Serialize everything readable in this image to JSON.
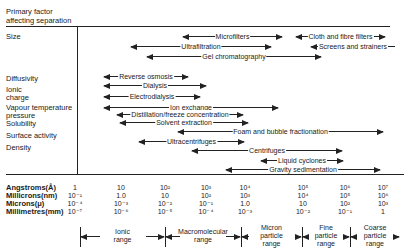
{
  "header": {
    "line1": "Primary factor",
    "line2": "affecting separation"
  },
  "factors": [
    {
      "label": "Size",
      "y": 38
    },
    {
      "label": "Diffusivity",
      "y": 80
    },
    {
      "label": "Ionic",
      "y": 91
    },
    {
      "label": "charge",
      "y": 99
    },
    {
      "label": "Vapour temperature",
      "y": 109
    },
    {
      "label": "pressure",
      "y": 117
    },
    {
      "label": "Solubility",
      "y": 125
    },
    {
      "label": "Surface activity",
      "y": 137
    },
    {
      "label": "Density",
      "y": 149
    }
  ],
  "methods": [
    {
      "label": "Microfilters",
      "x1": 183,
      "x2": 282,
      "y": 36
    },
    {
      "label": "Cloth and fibre filters",
      "x1": 296,
      "x2": 385,
      "y": 36
    },
    {
      "label": "Ultrafiltration",
      "x1": 131,
      "x2": 271,
      "y": 46
    },
    {
      "label": "Screens and strainers",
      "x1": 311,
      "x2": 395,
      "y": 46,
      "no_right_head": true
    },
    {
      "label": "Gel chromatography",
      "x1": 147,
      "x2": 321,
      "y": 56
    },
    {
      "label": "Reverse osmosis",
      "x1": 104,
      "x2": 188,
      "y": 76
    },
    {
      "label": "Dialysis",
      "x1": 104,
      "x2": 206,
      "y": 85
    },
    {
      "label": "Electrodialysis",
      "x1": 104,
      "x2": 200,
      "y": 96
    },
    {
      "label": "Ion exchange",
      "x1": 104,
      "x2": 278,
      "y": 107
    },
    {
      "label": "Distillation/freeze concentration",
      "x1": 117,
      "x2": 243,
      "y": 114
    },
    {
      "label": "Solvent extraction",
      "x1": 120,
      "x2": 248,
      "y": 122
    },
    {
      "label": "Foam and bubble fractionation",
      "x1": 178,
      "x2": 383,
      "y": 131
    },
    {
      "label": "Ultracentrifuges",
      "x1": 139,
      "x2": 244,
      "y": 141
    },
    {
      "label": "Centrifuges",
      "x1": 192,
      "x2": 342,
      "y": 150
    },
    {
      "label": "Liquid cyclones",
      "x1": 261,
      "x2": 343,
      "y": 160
    },
    {
      "label": "Gravity sedimentation",
      "x1": 226,
      "x2": 380,
      "y": 169
    }
  ],
  "scale": {
    "units": [
      "Angstroms(Å)",
      "Millicrons(nm)",
      "Microns(μ)",
      "Millimetres(mm)"
    ],
    "columns": [
      {
        "x": 75,
        "values": [
          "1",
          "10⁻¹",
          "10⁻⁴",
          "10⁻⁷"
        ]
      },
      {
        "x": 121,
        "values": [
          "10",
          "1.0",
          "10⁻³",
          "10⁻⁶"
        ]
      },
      {
        "x": 165,
        "values": [
          "10²",
          "10",
          "10⁻²",
          "10⁻⁵"
        ]
      },
      {
        "x": 206,
        "values": [
          "10³",
          "10²",
          "10⁻¹",
          "10⁻⁴"
        ]
      },
      {
        "x": 245,
        "values": [
          "10⁴",
          "10³",
          "1.0",
          "10⁻³"
        ]
      },
      {
        "x": 303,
        "values": [
          "10⁵",
          "10⁴",
          "10",
          "10⁻²"
        ]
      },
      {
        "x": 345,
        "values": [
          "10⁶",
          "10⁵",
          "10²",
          "10⁻¹"
        ]
      },
      {
        "x": 383,
        "values": [
          "10⁷",
          "10⁶",
          "10³",
          "1"
        ]
      }
    ]
  },
  "ranges": [
    {
      "line1": "Ionic",
      "line2": "range",
      "line3": "",
      "x1": 80,
      "x2": 165
    },
    {
      "line1": "Macromolecular",
      "line2": "range",
      "line3": "",
      "x1": 165,
      "x2": 241
    },
    {
      "line1": "Micron",
      "line2": "particle",
      "line3": "range",
      "x1": 241,
      "x2": 302
    },
    {
      "line1": "Fine",
      "line2": "particle",
      "line3": "range",
      "x1": 302,
      "x2": 350
    },
    {
      "line1": "Coarse",
      "line2": "particle",
      "line3": "range",
      "x1": 350,
      "x2": 400
    }
  ]
}
